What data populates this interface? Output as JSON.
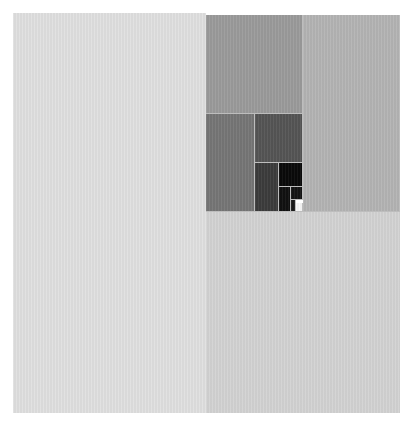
{
  "diagram": {
    "type": "recursive-square-subdivision",
    "background": "#ffffff",
    "tiles": [
      {
        "id": "left-large",
        "x": 13,
        "y": 13,
        "w": 193,
        "h": 400,
        "color": "#e0e0e0"
      },
      {
        "id": "bottom-right",
        "x": 206,
        "y": 212,
        "w": 194,
        "h": 201,
        "color": "#d3d3d3"
      },
      {
        "id": "right-upper",
        "x": 303,
        "y": 15,
        "w": 97,
        "h": 197,
        "color": "#b4b4b4"
      },
      {
        "id": "top-middle",
        "x": 206,
        "y": 15,
        "w": 97,
        "h": 99,
        "color": "#9b9b9b"
      },
      {
        "id": "middle-left",
        "x": 206,
        "y": 114,
        "w": 49,
        "h": 98,
        "color": "#767676"
      },
      {
        "id": "middle-upper-right",
        "x": 255,
        "y": 114,
        "w": 48,
        "h": 49,
        "color": "#555555"
      },
      {
        "id": "lower-left-small",
        "x": 255,
        "y": 163,
        "w": 24,
        "h": 49,
        "color": "#3c3c3c"
      },
      {
        "id": "black-square",
        "x": 279,
        "y": 163,
        "w": 24,
        "h": 24,
        "color": "#0a0a0a"
      },
      {
        "id": "tiny-left",
        "x": 279,
        "y": 187,
        "w": 12,
        "h": 25,
        "color": "#111111"
      },
      {
        "id": "tiny-upper-right",
        "x": 291,
        "y": 187,
        "w": 12,
        "h": 13,
        "color": "#141414"
      },
      {
        "id": "tiny-lower-mid",
        "x": 291,
        "y": 200,
        "w": 5,
        "h": 12,
        "color": "#1a1a1a"
      },
      {
        "id": "white-square",
        "x": 296,
        "y": 203,
        "w": 7,
        "h": 9,
        "color": "#f8f8f8"
      }
    ]
  }
}
